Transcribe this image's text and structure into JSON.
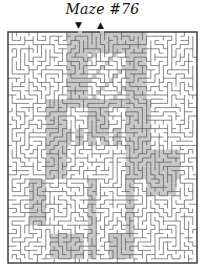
{
  "puzzle": {
    "title": "Maze #76",
    "entrance_marker": "▼",
    "exit_marker": "▲"
  },
  "colors": {
    "background": "#ffffff",
    "wall": "#555555",
    "border": "#333333",
    "figure_fill": "#c8c8c8"
  }
}
